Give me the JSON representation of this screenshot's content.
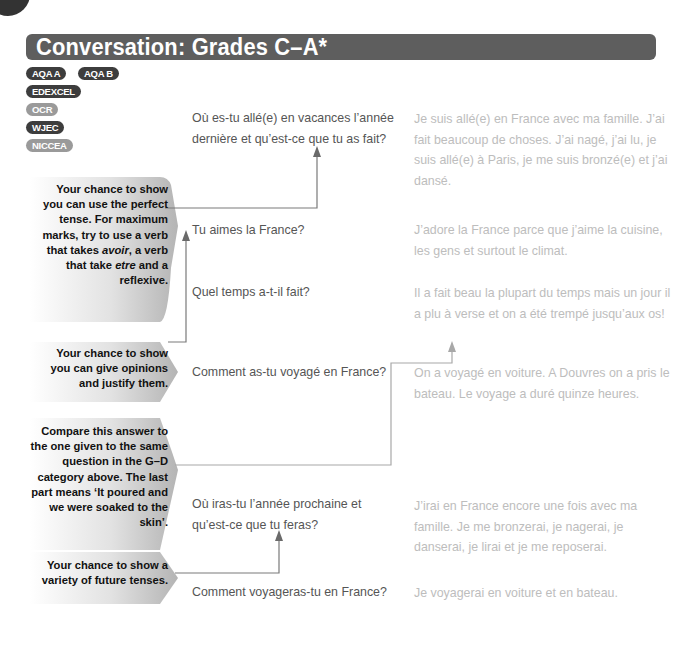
{
  "title": "Conversation: Grades C–A*",
  "exam_boards": [
    {
      "label": "AQA A",
      "style": "dark"
    },
    {
      "label": "AQA B",
      "style": "dark"
    },
    {
      "label": "EDEXCEL",
      "style": "dark"
    },
    {
      "label": "OCR",
      "style": "light"
    },
    {
      "label": "WJEC",
      "style": "dark"
    },
    {
      "label": "NICCEA",
      "style": "light"
    }
  ],
  "notes": [
    {
      "id": "perfect-tense",
      "parts": [
        "Your chance to show you can use the perfect tense. For maximum marks, try to use a verb that takes ",
        "avoir",
        ", a verb that take ",
        "etre",
        " and a reflexive."
      ]
    },
    {
      "id": "opinions",
      "text": "Your chance to show you can give opinions and justify them."
    },
    {
      "id": "compare",
      "text": "Compare this answer to the one given to the same question in the G–D category above. The last part means ‘It poured and we were soaked to the skin’."
    },
    {
      "id": "future",
      "text": "Your chance to show a variety of future tenses."
    }
  ],
  "conversation": [
    {
      "question": "Où es-tu allé(e) en vacances l’année dernière et qu’est-ce que tu as fait?",
      "answer": "Je suis allé(e) en France avec ma famille. J’ai fait beaucoup de choses. J’ai nagé, j’ai lu, je suis allé(e) à Paris, je me suis bronzé(e) et j’ai dansé."
    },
    {
      "question": "Tu aimes la France?",
      "answer": "J’adore la France parce que j’aime la cuisine, les gens et surtout le climat."
    },
    {
      "question": "Quel temps a-t-il fait?",
      "answer": "Il a fait beau la plupart du temps mais un jour il a plu à verse et on a été trempé jusqu’aux os!"
    },
    {
      "question": "Comment as-tu voyagé en France?",
      "answer": "On a voyagé en voiture. A Douvres on a pris le bateau. Le voyage a duré quinze heures."
    },
    {
      "question": "Où iras-tu l’année prochaine et qu’est-ce que tu feras?",
      "answer": "J’irai en France encore une fois avec ma famille. Je me bronzerai, je nagerai, je danserai, je lirai et je me reposerai."
    },
    {
      "question": "Comment voyageras-tu en France?",
      "answer": "Je voyagerai en voiture et en bateau."
    }
  ],
  "colors": {
    "title_bg": "#5e5e5e",
    "badge_dark": "#3d3d3d",
    "badge_light": "#9a9a9a",
    "question_text": "#555555",
    "answer_text": "#bdbdbd",
    "connector": "#7a7a7a"
  }
}
